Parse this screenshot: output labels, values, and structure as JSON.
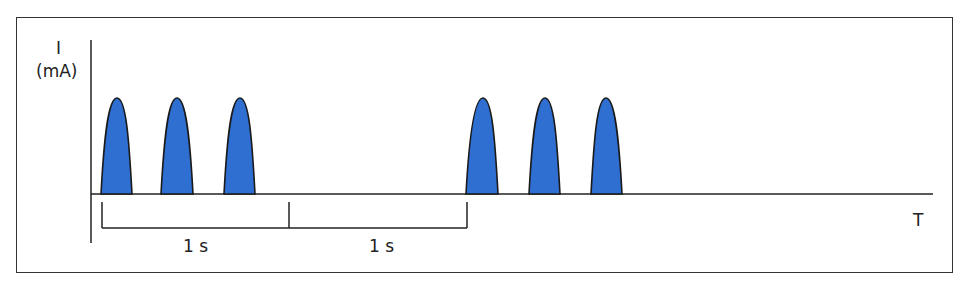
{
  "diagram": {
    "y_axis": {
      "label_line1": "I",
      "label_line2": "(mA)"
    },
    "x_axis": {
      "label": "T"
    },
    "intervals": [
      {
        "label": "1 s",
        "x_start": 102,
        "x_end": 289
      },
      {
        "label": "1 s",
        "x_start": 289,
        "x_end": 467
      }
    ],
    "pulse_groups": [
      {
        "pulses": [
          {
            "left": 101,
            "right": 132,
            "peak": 117
          },
          {
            "left": 161,
            "right": 193,
            "peak": 177
          },
          {
            "left": 224,
            "right": 255,
            "peak": 240
          }
        ]
      },
      {
        "pulses": [
          {
            "left": 466,
            "right": 498,
            "peak": 483
          },
          {
            "left": 529,
            "right": 560,
            "peak": 545
          },
          {
            "left": 591,
            "right": 622,
            "peak": 606
          }
        ]
      }
    ],
    "colors": {
      "pulse_fill": "#2f6fd2",
      "stroke": "#1a1a1a",
      "frame": "#333333"
    }
  }
}
